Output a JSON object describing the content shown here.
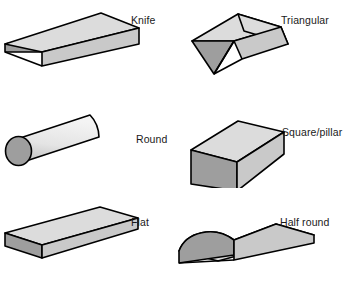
{
  "figure": {
    "background_color": "#ffffff",
    "outline_color": "#000000",
    "top_face_color": "#dcdcdc",
    "side_face_color": "#c9c9c9",
    "end_face_color": "#9e9e9e",
    "label_color": "#1a1a1a"
  },
  "shapes": [
    {
      "id": "knife",
      "label": "Knife",
      "row": 0,
      "column": 0,
      "icon": "knife-file-profile-icon",
      "description": "Tapered wedge bar with knife edge"
    },
    {
      "id": "triangular",
      "label": "Triangular",
      "row": 0,
      "column": 1,
      "icon": "triangular-file-profile-icon",
      "description": "Three sided prism bar with triangular end face"
    },
    {
      "id": "round",
      "label": "Round",
      "row": 1,
      "column": 0,
      "icon": "round-file-profile-icon",
      "description": "Cylindrical bar with circular end face"
    },
    {
      "id": "square_pillar",
      "label": "Square/pillar",
      "row": 1,
      "column": 1,
      "icon": "square-pillar-file-profile-icon",
      "description": "Square cross-section bar"
    },
    {
      "id": "flat",
      "label": "Flat",
      "row": 2,
      "column": 0,
      "icon": "flat-file-profile-icon",
      "description": "Thin rectangular flat bar"
    },
    {
      "id": "half_round",
      "label": "Half round",
      "row": 2,
      "column": 1,
      "icon": "half-round-file-profile-icon",
      "description": "Flat bottom bar with domed half-round top"
    }
  ]
}
